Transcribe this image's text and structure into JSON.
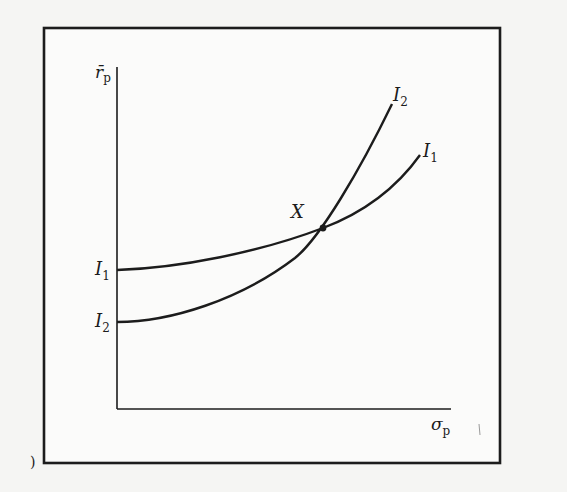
{
  "diagram": {
    "title": "",
    "axes": {
      "y_label": {
        "base": "r̄",
        "sub": "p"
      },
      "x_label": {
        "base": "σ",
        "sub": "p"
      }
    },
    "curves": [
      {
        "name": "I1",
        "label_left": {
          "base": "I",
          "sub": "1"
        },
        "label_right": {
          "base": "I",
          "sub": "1"
        },
        "description": "flatter indifference curve, higher intercept"
      },
      {
        "name": "I2",
        "label_left": {
          "base": "I",
          "sub": "2"
        },
        "label_right": {
          "base": "I",
          "sub": "2"
        },
        "description": "steeper indifference curve, lower intercept"
      }
    ],
    "intersection": {
      "label": "X"
    },
    "stray_mark": ")"
  },
  "colors": {
    "ink": "#1c1c1c",
    "paper": "#f5f5f3"
  }
}
